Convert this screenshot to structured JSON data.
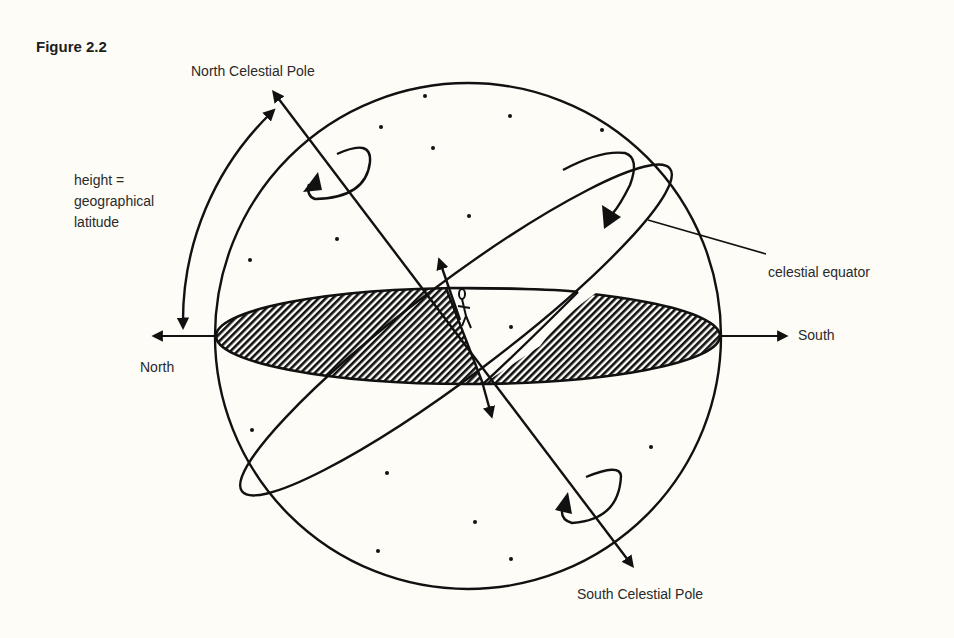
{
  "figure": {
    "title": "Figure 2.2"
  },
  "labels": {
    "north_celestial_pole": "North Celestial Pole",
    "south_celestial_pole": "South Celestial Pole",
    "height_line1": "height =",
    "height_line2": "geographical",
    "height_line3": "latitude",
    "celestial_equator": "celestial equator",
    "north": "North",
    "south": "South"
  },
  "colors": {
    "ink": "#111111",
    "paper": "#fdfcf7"
  },
  "geometry": {
    "sphere_center": [
      468,
      336
    ],
    "sphere_radius": 253,
    "horizon": {
      "cx": 468,
      "cy": 336,
      "rx": 252,
      "ry": 48
    },
    "observer": [
      483,
      385
    ],
    "celestial_axis": {
      "from": [
        270,
        88
      ],
      "to": [
        636,
        570
      ]
    }
  },
  "stars": [
    [
      425,
      96
    ],
    [
      510,
      116
    ],
    [
      602,
      130
    ],
    [
      381,
      127
    ],
    [
      433,
      148
    ],
    [
      469,
      216
    ],
    [
      337,
      239
    ],
    [
      250,
      260
    ],
    [
      511,
      327
    ],
    [
      252,
      430
    ],
    [
      651,
      447
    ],
    [
      387,
      473
    ],
    [
      475,
      522
    ],
    [
      378,
      551
    ],
    [
      511,
      559
    ]
  ]
}
